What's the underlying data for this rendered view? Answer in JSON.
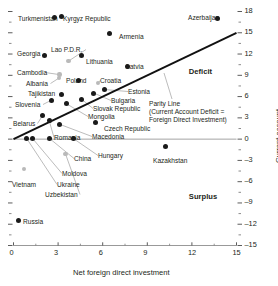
{
  "chart_data": {
    "type": "scatter",
    "title": "",
    "xlabel": "Net foreign direct investment",
    "ylabel": "Current account",
    "xlim": [
      0,
      15
    ],
    "ylim": [
      -15,
      18
    ],
    "xticks": [
      0,
      3,
      6,
      9,
      12,
      15
    ],
    "yticks": [
      18,
      15,
      12,
      9,
      6,
      3,
      0,
      -3,
      -6,
      -9,
      -12,
      -15
    ],
    "xtick_labels": [
      "0",
      "3",
      "6",
      "9",
      "12",
      "15"
    ],
    "ytick_labels": [
      "18",
      "15",
      "12",
      "9",
      "6",
      "3",
      "0",
      "-3",
      "-6",
      "-9",
      "-12",
      "-15"
    ],
    "grid": false,
    "zero_line": true,
    "legend": "none",
    "reference_line": {
      "name": "Parity Line",
      "note_line1": "Parity Line",
      "note_line2": "(Current Account Deficit =",
      "note_line3": "Foreign Direct Investment)",
      "from": [
        0,
        0
      ],
      "to": [
        15,
        15
      ]
    },
    "region_labels": [
      {
        "text": "Deficit",
        "x": 12.2,
        "y": 9.6
      },
      {
        "text": "Surplus",
        "x": 12.2,
        "y": -8.0
      }
    ],
    "points": [
      {
        "label": "Turkmenistan",
        "x": 2.75,
        "y": 17.1,
        "style": "solid",
        "lx": 18,
        "ly": 15,
        "leader": false
      },
      {
        "label": "Kyrgyz Republic",
        "x": 3.25,
        "y": 17.3,
        "style": "solid",
        "lx": 63,
        "ly": 15,
        "leader": false
      },
      {
        "label": "Azerbaijan",
        "x": 13.7,
        "y": 17.0,
        "style": "solid",
        "lx": 188,
        "ly": 14,
        "leader": false
      },
      {
        "label": "Armenia",
        "x": 6.45,
        "y": 14.9,
        "style": "solid",
        "lx": 119,
        "ly": 33,
        "leader": false
      },
      {
        "label": "Georgia",
        "x": 2.1,
        "y": 11.8,
        "style": "solid",
        "lx": 17,
        "ly": 50,
        "leader": false
      },
      {
        "label": "Lao P.D.R.",
        "x": 3.7,
        "y": 11.0,
        "style": "hollow",
        "lx": 51,
        "ly": 46,
        "leader": true
      },
      {
        "label": "Lithuania",
        "x": 4.6,
        "y": 11.8,
        "style": "solid",
        "lx": 86,
        "ly": 58,
        "leader": false
      },
      {
        "label": "Latvia",
        "x": 7.7,
        "y": 10.2,
        "style": "solid",
        "lx": 126,
        "ly": 63,
        "leader": false
      },
      {
        "label": "Cambodia",
        "x": 3.1,
        "y": 9.1,
        "style": "hollow",
        "lx": 17,
        "ly": 69,
        "leader": true
      },
      {
        "label": "Poland",
        "x": 4.35,
        "y": 8.2,
        "style": "solid",
        "lx": 66,
        "ly": 77,
        "leader": false
      },
      {
        "label": "Croatia",
        "x": 5.7,
        "y": 7.9,
        "style": "hollow",
        "lx": 100,
        "ly": 77,
        "leader": true
      },
      {
        "label": "Albania",
        "x": 3.05,
        "y": 8.6,
        "style": "hollow",
        "lx": 26,
        "ly": 80,
        "leader": true
      },
      {
        "label": "Tajikistan",
        "x": 3.25,
        "y": 6.3,
        "style": "solid",
        "lx": 28,
        "ly": 90,
        "leader": true
      },
      {
        "label": "Estonia",
        "x": 6.1,
        "y": 7.0,
        "style": "solid",
        "lx": 128,
        "ly": 88,
        "leader": true
      },
      {
        "label": "Bulgaria",
        "x": 5.4,
        "y": 6.5,
        "style": "solid",
        "lx": 111,
        "ly": 97,
        "leader": true
      },
      {
        "label": "Slovak Republic",
        "x": 4.6,
        "y": 5.6,
        "style": "solid",
        "lx": 93,
        "ly": 105,
        "leader": true
      },
      {
        "label": "Slovenia",
        "x": 2.55,
        "y": 5.5,
        "style": "solid",
        "lx": 15,
        "ly": 101,
        "leader": true
      },
      {
        "label": "Mongolia",
        "x": 3.55,
        "y": 5.0,
        "style": "solid",
        "lx": 88,
        "ly": 113,
        "leader": true
      },
      {
        "label": "Belarus",
        "x": 1.95,
        "y": 3.3,
        "style": "solid",
        "lx": 13,
        "ly": 120,
        "leader": true
      },
      {
        "label": "Czech Republic",
        "x": 5.5,
        "y": 2.3,
        "style": "solid",
        "lx": 104,
        "ly": 125,
        "leader": false
      },
      {
        "label": "Macedonia",
        "x": 3.1,
        "y": 2.1,
        "style": "solid",
        "lx": 92,
        "ly": 133,
        "leader": true
      },
      {
        "label": "Romania",
        "x": 2.4,
        "y": 2.6,
        "style": "solid",
        "lx": 54,
        "ly": 134,
        "leader": true
      },
      {
        "label": "Hungary",
        "x": 4.05,
        "y": 0.05,
        "style": "solid",
        "lx": 98,
        "ly": 152,
        "leader": true
      },
      {
        "label": "China",
        "x": 2.45,
        "y": 0.05,
        "style": "solid",
        "lx": 74,
        "ly": 155,
        "leader": true
      },
      {
        "label": "Moldova",
        "x": 1.3,
        "y": 0.05,
        "style": "solid",
        "lx": 62,
        "ly": 170,
        "leader": true
      },
      {
        "label": "Ukraine",
        "x": 0.9,
        "y": 0.05,
        "style": "solid",
        "lx": 57,
        "ly": 181,
        "leader": true
      },
      {
        "label": "Uzbekistan",
        "x": 3.5,
        "y": -2.1,
        "style": "hollow",
        "lx": 45,
        "ly": 191,
        "leader": true
      },
      {
        "label": "Vietnam",
        "x": 0.7,
        "y": -4.2,
        "style": "hollow",
        "lx": 12,
        "ly": 181,
        "leader": false
      },
      {
        "label": "Kazakhstan",
        "x": 10.2,
        "y": -1.0,
        "style": "solid",
        "lx": 153,
        "ly": 157,
        "leader": false
      },
      {
        "label": "Russia",
        "x": 0.35,
        "y": -11.5,
        "style": "solid",
        "lx": 23,
        "ly": 218,
        "leader": false
      }
    ]
  }
}
